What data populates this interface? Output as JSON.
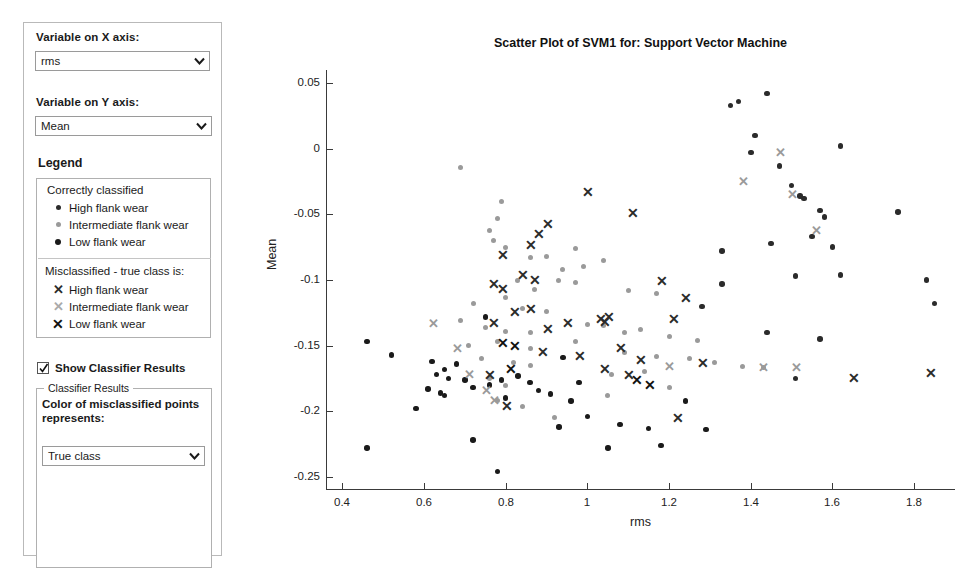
{
  "sidebar": {
    "x_axis": {
      "label": "Variable on X axis:",
      "value": "rms",
      "options": [
        "rms",
        "Mean",
        "Std",
        "Kurtosis",
        "Skewness"
      ]
    },
    "y_axis": {
      "label": "Variable on Y axis:",
      "value": "Mean",
      "options": [
        "rms",
        "Mean",
        "Std",
        "Kurtosis",
        "Skewness"
      ]
    },
    "legend": {
      "title": "Legend",
      "correct_title": "Correctly classified",
      "correct_items": [
        {
          "marker": "dot",
          "color": "#2b2b2b",
          "label": "High flank wear"
        },
        {
          "marker": "dot",
          "color": "#9a9a9a",
          "label": "Intermediate flank wear"
        },
        {
          "marker": "dot",
          "color": "#1a1a1a",
          "label": "Low flank wear"
        }
      ],
      "misclassified_title": "Misclassified - true class is:",
      "misclassified_items": [
        {
          "marker": "cross",
          "color": "#2b2b2b",
          "label": "High flank wear"
        },
        {
          "marker": "cross",
          "color": "#9a9a9a",
          "label": "Intermediate flank wear"
        },
        {
          "marker": "cross",
          "color": "#111111",
          "label": "Low flank wear"
        }
      ]
    },
    "show_classifier_results": {
      "label": "Show Classifier Results",
      "checked": true
    },
    "classifier_results": {
      "group_label": "Classifier Results",
      "description": "Color of misclassified points represents:",
      "value": "True class",
      "options": [
        "True class",
        "Predicted class"
      ]
    }
  },
  "colors": {
    "high_flank": "#2b2b2b",
    "intermediate_flank": "#9a9a9a",
    "low_flank": "#111111",
    "axis": "#3a3a3a",
    "panel_border": "#b0b0b0"
  },
  "chart_data": {
    "type": "scatter",
    "title": "Scatter Plot of SVM1 for: Support Vector Machine",
    "xlabel": "rms",
    "ylabel": "Mean",
    "xlim": [
      0.36,
      1.9
    ],
    "ylim": [
      -0.26,
      0.06
    ],
    "xticks": [
      0.4,
      0.6,
      0.8,
      1.0,
      1.2,
      1.4,
      1.6,
      1.8
    ],
    "xticklabels": [
      "0.4",
      "0.6",
      "0.8",
      "1",
      "1.2",
      "1.4",
      "1.6",
      "1.8"
    ],
    "yticks": [
      0.05,
      0,
      -0.05,
      -0.1,
      -0.15,
      -0.2,
      -0.25
    ],
    "yticklabels": [
      "0.05",
      "0",
      "-0.05",
      "-0.1",
      "-0.15",
      "-0.2",
      "-0.25"
    ],
    "grid": false,
    "legend_position": "external-sidebar",
    "series": [
      {
        "name": "Correctly classified - High flank wear",
        "marker": "dot",
        "color": "#2b2b2b",
        "points": [
          [
            1.35,
            0.033
          ],
          [
            1.37,
            0.036
          ],
          [
            1.44,
            0.042
          ],
          [
            1.41,
            0.01
          ],
          [
            1.4,
            -0.003
          ],
          [
            1.47,
            -0.013
          ],
          [
            1.62,
            0.002
          ],
          [
            1.5,
            -0.028
          ],
          [
            1.52,
            -0.036
          ],
          [
            1.53,
            -0.038
          ],
          [
            1.57,
            -0.047
          ],
          [
            1.76,
            -0.048
          ],
          [
            1.58,
            -0.052
          ],
          [
            1.55,
            -0.067
          ],
          [
            1.45,
            -0.072
          ],
          [
            1.6,
            -0.075
          ],
          [
            1.33,
            -0.078
          ],
          [
            1.83,
            -0.1
          ],
          [
            1.85,
            -0.118
          ],
          [
            1.51,
            -0.097
          ],
          [
            1.62,
            -0.096
          ],
          [
            1.44,
            -0.14
          ],
          [
            1.57,
            -0.145
          ],
          [
            1.51,
            -0.175
          ],
          [
            1.28,
            -0.12
          ],
          [
            1.33,
            -0.103
          ]
        ]
      },
      {
        "name": "Correctly classified - Intermediate flank wear",
        "marker": "dot",
        "color": "#9a9a9a",
        "points": [
          [
            0.69,
            -0.014
          ],
          [
            0.79,
            -0.04
          ],
          [
            0.78,
            -0.053
          ],
          [
            0.76,
            -0.062
          ],
          [
            0.77,
            -0.07
          ],
          [
            0.8,
            -0.075
          ],
          [
            0.86,
            -0.083
          ],
          [
            0.9,
            -0.082
          ],
          [
            0.97,
            -0.076
          ],
          [
            0.94,
            -0.092
          ],
          [
            0.99,
            -0.09
          ],
          [
            1.04,
            -0.085
          ],
          [
            0.93,
            -0.1
          ],
          [
            0.97,
            -0.102
          ],
          [
            0.83,
            -0.1
          ],
          [
            0.87,
            -0.107
          ],
          [
            0.8,
            -0.113
          ],
          [
            0.72,
            -0.118
          ],
          [
            0.84,
            -0.122
          ],
          [
            0.9,
            -0.124
          ],
          [
            1.1,
            -0.108
          ],
          [
            1.17,
            -0.11
          ],
          [
            0.69,
            -0.131
          ],
          [
            0.75,
            -0.136
          ],
          [
            0.8,
            -0.139
          ],
          [
            0.86,
            -0.14
          ],
          [
            1.0,
            -0.134
          ],
          [
            1.04,
            -0.135
          ],
          [
            0.78,
            -0.147
          ],
          [
            0.71,
            -0.15
          ],
          [
            0.86,
            -0.152
          ],
          [
            0.97,
            -0.147
          ],
          [
            1.09,
            -0.14
          ],
          [
            1.13,
            -0.138
          ],
          [
            1.2,
            -0.143
          ],
          [
            1.27,
            -0.146
          ],
          [
            0.74,
            -0.16
          ],
          [
            0.82,
            -0.163
          ],
          [
            0.86,
            -0.165
          ],
          [
            1.09,
            -0.155
          ],
          [
            1.17,
            -0.158
          ],
          [
            1.25,
            -0.16
          ],
          [
            1.31,
            -0.163
          ],
          [
            0.76,
            -0.175
          ],
          [
            0.8,
            -0.18
          ],
          [
            1.06,
            -0.172
          ],
          [
            1.14,
            -0.17
          ],
          [
            1.38,
            -0.166
          ],
          [
            1.43,
            -0.167
          ],
          [
            0.78,
            -0.192
          ],
          [
            0.84,
            -0.196
          ],
          [
            1.05,
            -0.188
          ],
          [
            1.2,
            -0.182
          ],
          [
            0.92,
            -0.205
          ]
        ]
      },
      {
        "name": "Correctly classified - Low flank wear",
        "marker": "dot",
        "color": "#1a1a1a",
        "points": [
          [
            0.46,
            -0.147
          ],
          [
            0.52,
            -0.157
          ],
          [
            0.62,
            -0.162
          ],
          [
            0.65,
            -0.168
          ],
          [
            0.68,
            -0.164
          ],
          [
            0.63,
            -0.172
          ],
          [
            0.66,
            -0.175
          ],
          [
            0.7,
            -0.176
          ],
          [
            0.61,
            -0.183
          ],
          [
            0.64,
            -0.186
          ],
          [
            0.65,
            -0.188
          ],
          [
            0.72,
            -0.182
          ],
          [
            0.76,
            -0.18
          ],
          [
            0.79,
            -0.176
          ],
          [
            0.83,
            -0.173
          ],
          [
            0.88,
            -0.184
          ],
          [
            0.8,
            -0.19
          ],
          [
            0.96,
            -0.192
          ],
          [
            0.58,
            -0.198
          ],
          [
            0.91,
            -0.187
          ],
          [
            0.46,
            -0.228
          ],
          [
            0.72,
            -0.222
          ],
          [
            0.78,
            -0.246
          ],
          [
            0.93,
            -0.212
          ],
          [
            1.0,
            -0.204
          ],
          [
            1.08,
            -0.21
          ],
          [
            1.15,
            -0.213
          ],
          [
            1.05,
            -0.228
          ],
          [
            1.18,
            -0.226
          ],
          [
            0.98,
            -0.178
          ],
          [
            0.86,
            -0.178
          ],
          [
            1.24,
            -0.192
          ],
          [
            1.29,
            -0.214
          ],
          [
            0.75,
            -0.128
          ],
          [
            0.94,
            -0.159
          ]
        ]
      },
      {
        "name": "Misclassified - High flank wear",
        "marker": "cross",
        "color": "#2b2b2b",
        "points": [
          [
            0.79,
            -0.081
          ],
          [
            0.88,
            -0.065
          ],
          [
            0.86,
            -0.073
          ],
          [
            0.9,
            -0.057
          ],
          [
            0.77,
            -0.103
          ],
          [
            0.79,
            -0.107
          ],
          [
            0.84,
            -0.096
          ],
          [
            0.87,
            -0.1
          ],
          [
            1.0,
            -0.033
          ],
          [
            1.11,
            -0.049
          ],
          [
            1.18,
            -0.101
          ],
          [
            1.24,
            -0.114
          ],
          [
            1.21,
            -0.13
          ],
          [
            1.05,
            -0.128
          ],
          [
            1.03,
            -0.13
          ],
          [
            1.04,
            -0.132
          ],
          [
            0.82,
            -0.124
          ],
          [
            0.86,
            -0.122
          ],
          [
            0.9,
            -0.137
          ],
          [
            0.95,
            -0.133
          ],
          [
            0.77,
            -0.133
          ],
          [
            0.98,
            -0.158
          ],
          [
            0.89,
            -0.155
          ],
          [
            1.08,
            -0.152
          ],
          [
            1.1,
            -0.172
          ],
          [
            1.04,
            -0.168
          ],
          [
            1.13,
            -0.161
          ],
          [
            1.28,
            -0.163
          ],
          [
            0.76,
            -0.172
          ],
          [
            0.8,
            -0.196
          ],
          [
            1.22,
            -0.205
          ],
          [
            1.84,
            -0.171
          ],
          [
            1.65,
            -0.175
          ]
        ]
      },
      {
        "name": "Misclassified - Intermediate flank wear",
        "marker": "cross",
        "color": "#9a9a9a",
        "points": [
          [
            0.62,
            -0.133
          ],
          [
            0.68,
            -0.152
          ],
          [
            0.71,
            -0.172
          ],
          [
            0.75,
            -0.184
          ],
          [
            0.77,
            -0.192
          ],
          [
            1.47,
            -0.003
          ],
          [
            1.38,
            -0.025
          ],
          [
            1.56,
            -0.062
          ],
          [
            1.5,
            -0.035
          ],
          [
            1.51,
            -0.167
          ],
          [
            1.43,
            -0.167
          ],
          [
            1.2,
            -0.166
          ]
        ]
      },
      {
        "name": "Misclassified - Low flank wear",
        "marker": "cross",
        "color": "#111111",
        "points": [
          [
            0.79,
            -0.148
          ],
          [
            0.82,
            -0.15
          ],
          [
            0.81,
            -0.168
          ],
          [
            1.12,
            -0.176
          ],
          [
            1.15,
            -0.18
          ]
        ]
      }
    ]
  }
}
